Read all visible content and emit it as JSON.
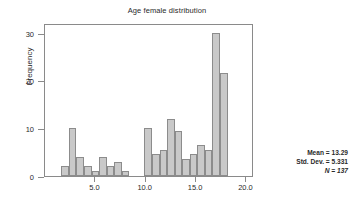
{
  "chart_data": {
    "type": "bar",
    "title": "Age female distribution",
    "xlabel": "",
    "ylabel": "Frequency",
    "xlim": [
      0.0,
      20.75
    ],
    "ylim": [
      0,
      32
    ],
    "grid": false,
    "legend": null,
    "bin_width": 0.75,
    "x_ticks": [
      "5.0",
      "10.0",
      "15.0",
      "20.0"
    ],
    "x_tick_values": [
      5.0,
      10.0,
      15.0,
      20.0
    ],
    "y_ticks": [
      "0",
      "10",
      "20",
      "30"
    ],
    "y_tick_values": [
      0,
      10,
      20,
      30
    ],
    "bin_centers": [
      2.0,
      2.75,
      3.5,
      4.25,
      5.0,
      5.75,
      6.5,
      7.25,
      8.0,
      10.25,
      11.0,
      11.75,
      12.5,
      13.25,
      14.0,
      14.75,
      15.5,
      16.25,
      17.0,
      17.75,
      18.5
    ],
    "values": [
      2,
      10,
      4,
      2,
      1,
      4,
      2,
      3,
      1,
      10,
      4.5,
      5.5,
      12,
      9.5,
      3.5,
      4.5,
      6.5,
      5.5,
      30,
      21.5
    ],
    "bars": [
      {
        "x": 1.625,
        "value": 2
      },
      {
        "x": 2.375,
        "value": 10
      },
      {
        "x": 3.125,
        "value": 4
      },
      {
        "x": 3.875,
        "value": 2
      },
      {
        "x": 4.625,
        "value": 1
      },
      {
        "x": 5.375,
        "value": 4
      },
      {
        "x": 6.125,
        "value": 2
      },
      {
        "x": 6.875,
        "value": 3
      },
      {
        "x": 7.625,
        "value": 1
      },
      {
        "x": 9.875,
        "value": 10
      },
      {
        "x": 10.625,
        "value": 4.5
      },
      {
        "x": 11.375,
        "value": 5.5
      },
      {
        "x": 12.125,
        "value": 12
      },
      {
        "x": 12.875,
        "value": 9.5
      },
      {
        "x": 13.625,
        "value": 3.5
      },
      {
        "x": 14.375,
        "value": 4.5
      },
      {
        "x": 15.125,
        "value": 6.5
      },
      {
        "x": 15.875,
        "value": 5.5
      },
      {
        "x": 16.625,
        "value": 30
      },
      {
        "x": 17.375,
        "value": 21.5
      }
    ],
    "annotations": {
      "mean_label": "Mean = 13.29",
      "std_dev_label": "Std. Dev. = 5.331",
      "n_label": "N = 137",
      "mean_value": 13.29,
      "std_dev_value": 5.331,
      "n_value": 137,
      "position": "right"
    },
    "colors": {
      "bar_fill": "#c9c9c9",
      "bar_border": "#8c8c8c",
      "axis": "#8a8a8a",
      "text": "#2a2a2a",
      "background": "#ffffff"
    }
  }
}
